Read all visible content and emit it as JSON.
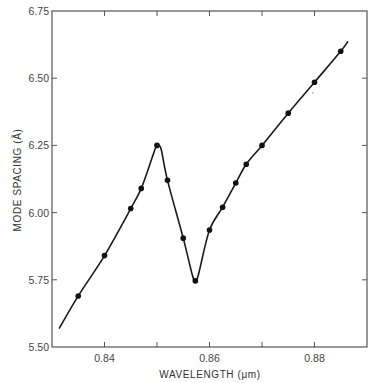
{
  "chart_data": {
    "type": "line",
    "title": "",
    "xlabel": "WAVELENGTH (μm)",
    "ylabel": "MODE SPACING (Å)",
    "xlim": [
      0.83,
      0.89
    ],
    "ylim": [
      5.5,
      6.75
    ],
    "x_ticks": [
      0.84,
      0.86,
      0.88
    ],
    "x_tick_labels": [
      "0.84",
      "0.86",
      "0.88"
    ],
    "x_minor_ticks": [
      0.85,
      0.87
    ],
    "y_ticks": [
      5.5,
      5.75,
      6.0,
      6.25,
      6.5,
      6.75
    ],
    "y_tick_labels": [
      "5.50",
      "5.75",
      "6.00",
      "6.25",
      "6.50",
      "6.75"
    ],
    "grid": false,
    "legend": null,
    "series": [
      {
        "name": "measured",
        "style": "markers",
        "x": [
          0.835,
          0.84,
          0.845,
          0.847,
          0.85,
          0.852,
          0.855,
          0.8573,
          0.86,
          0.8625,
          0.865,
          0.867,
          0.87,
          0.875,
          0.88,
          0.885
        ],
        "y": [
          5.69,
          5.84,
          6.015,
          6.09,
          6.25,
          6.12,
          5.905,
          5.746,
          5.935,
          6.02,
          6.11,
          6.18,
          6.25,
          6.37,
          6.485,
          6.6
        ]
      },
      {
        "name": "fitted curve",
        "style": "line",
        "x": [
          0.8314,
          0.835,
          0.84,
          0.845,
          0.847,
          0.849,
          0.8498,
          0.8502,
          0.8508,
          0.852,
          0.855,
          0.8567,
          0.8573,
          0.8579,
          0.86,
          0.8625,
          0.865,
          0.867,
          0.87,
          0.875,
          0.88,
          0.885,
          0.8863
        ],
        "y": [
          5.57,
          5.69,
          5.84,
          6.015,
          6.09,
          6.2,
          6.245,
          6.25,
          6.235,
          6.12,
          5.905,
          5.77,
          5.745,
          5.77,
          5.935,
          6.02,
          6.11,
          6.18,
          6.25,
          6.37,
          6.485,
          6.6,
          6.635
        ]
      }
    ],
    "annotations": [
      {
        "text": "′",
        "x": 0.8795,
        "y": 6.43,
        "note": "stray mark"
      }
    ]
  },
  "axes": {
    "xlabel": "WAVELENGTH (μm)",
    "ylabel": "MODE SPACING (Å)"
  }
}
